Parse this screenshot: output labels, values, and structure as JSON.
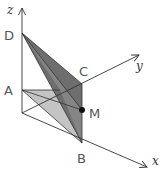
{
  "diagram": {
    "type": "3d-geometry",
    "axes": {
      "x": {
        "label": "x"
      },
      "y": {
        "label": "y"
      },
      "z": {
        "label": "z"
      }
    },
    "points": {
      "D": {
        "label": "D"
      },
      "A": {
        "label": "A"
      },
      "C": {
        "label": "C"
      },
      "M": {
        "label": "M"
      },
      "B": {
        "label": "B"
      }
    },
    "colors": {
      "dark_face": "#6e6e6e",
      "mid_face": "#8c8c8c",
      "light_face": "#c4c4c4",
      "line": "#333333",
      "label": "#555555"
    }
  }
}
